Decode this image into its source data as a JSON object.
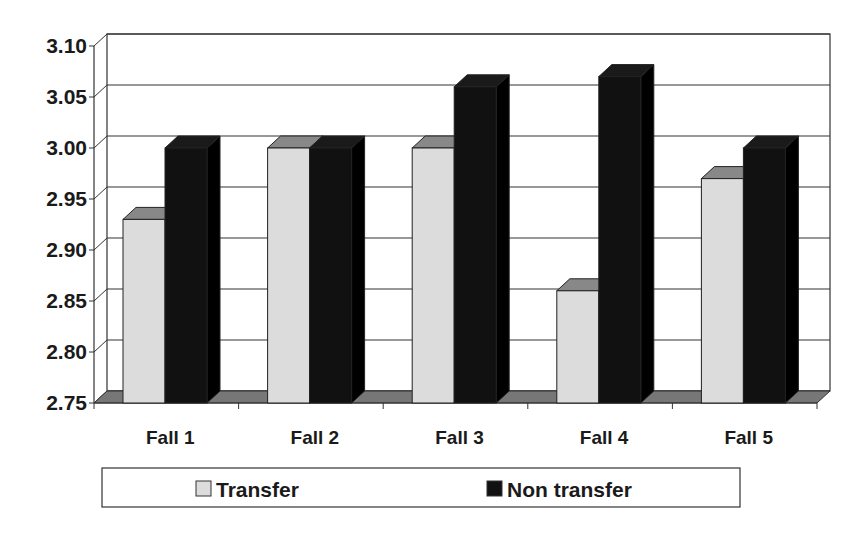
{
  "chart_data": {
    "type": "bar",
    "title": "",
    "xlabel": "",
    "ylabel": "",
    "ylim": [
      2.75,
      3.1
    ],
    "yticks": [
      "2.75",
      "2.80",
      "2.85",
      "2.90",
      "2.95",
      "3.00",
      "3.05",
      "3.10"
    ],
    "categories": [
      "Fall 1",
      "Fall 2",
      "Fall 3",
      "Fall 4",
      "Fall 5"
    ],
    "series": [
      {
        "name": "Transfer",
        "color": "#dcdcdc",
        "values": [
          2.93,
          3.0,
          3.0,
          2.86,
          2.97
        ]
      },
      {
        "name": "Non transfer",
        "color": "#111111",
        "values": [
          3.0,
          3.0,
          3.06,
          3.07,
          3.0
        ]
      }
    ],
    "grid": true,
    "legend_position": "bottom",
    "style": "3d-clustered-column"
  },
  "legend": {
    "items": [
      {
        "label": "Transfer"
      },
      {
        "label": "Non transfer"
      }
    ]
  }
}
